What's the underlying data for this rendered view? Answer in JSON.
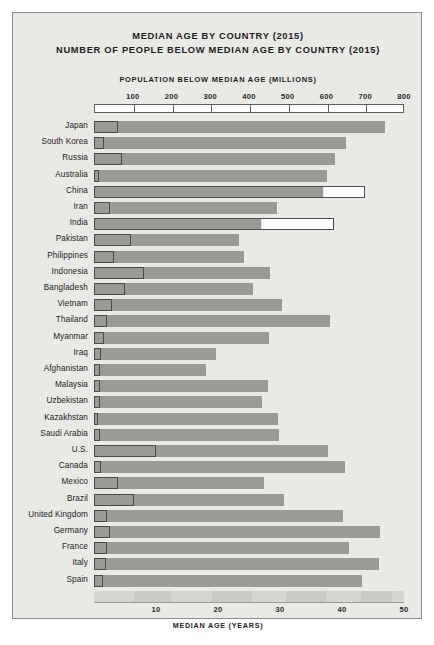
{
  "titles": {
    "line1": "MEDIAN AGE BY COUNTRY (2015)",
    "line2": "NUMBER OF PEOPLE BELOW MEDIAN AGE BY COUNTRY (2015)"
  },
  "axes": {
    "top_title": "POPULATION BELOW MEDIAN AGE (MILLIONS)",
    "bottom_title": "MEDIAN AGE (YEARS)",
    "top_ticks": [
      100,
      200,
      300,
      400,
      500,
      600,
      700,
      800
    ],
    "bottom_ticks": [
      10,
      20,
      30,
      40,
      50
    ]
  },
  "colors": {
    "panel_background": "#e9e9e6",
    "panel_border": "#8d8d8a",
    "age_bar": "#9a9a97",
    "population_bar_outline": "#4a4a48",
    "population_bar_fill": "#ffffff",
    "text": "#1d1d1d",
    "page_background": "#ffffff"
  },
  "chart_data": {
    "type": "bar",
    "orientation": "horizontal",
    "grid": false,
    "legend_position": "none",
    "xlabel": "MEDIAN AGE (YEARS)",
    "xlabel_top": "POPULATION BELOW MEDIAN AGE (MILLIONS)",
    "ylabel": "",
    "xlim_age": [
      0,
      50
    ],
    "xlim_population": [
      0,
      800
    ],
    "categories": [
      "Japan",
      "South Korea",
      "Russia",
      "Australia",
      "China",
      "Iran",
      "India",
      "Pakistan",
      "Philippines",
      "Indonesia",
      "Bangladesh",
      "Vietnam",
      "Thailand",
      "Myanmar",
      "Iraq",
      "Afghanistan",
      "Malaysia",
      "Uzbekistan",
      "Kazakhstan",
      "Saudi Arabia",
      "U.S.",
      "Canada",
      "Mexico",
      "Brazil",
      "United Kingdom",
      "Germany",
      "France",
      "Italy",
      "Spain"
    ],
    "series": [
      {
        "name": "Median age (years)",
        "axis": "bottom",
        "values": [
          46.9,
          40.6,
          38.9,
          37.5,
          37.0,
          29.5,
          27.0,
          23.4,
          24.2,
          28.4,
          25.6,
          30.4,
          38.0,
          28.2,
          19.7,
          18.0,
          28.0,
          27.1,
          29.7,
          29.8,
          37.8,
          40.5,
          27.4,
          30.7,
          40.2,
          46.1,
          41.1,
          45.9,
          43.2
        ]
      },
      {
        "name": "Population below median age (millions)",
        "axis": "top",
        "values": [
          63,
          25,
          72,
          12,
          700,
          40,
          620,
          95,
          51,
          130,
          80,
          46,
          34,
          27,
          18,
          16,
          15,
          16,
          9,
          16,
          160,
          18,
          62,
          103,
          33,
          41,
          33,
          30,
          23
        ]
      }
    ]
  }
}
